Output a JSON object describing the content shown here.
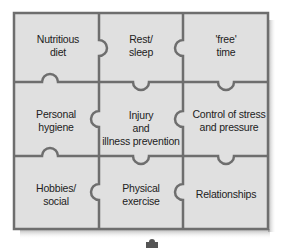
{
  "diagram": {
    "type": "jigsaw-puzzle",
    "colors": {
      "piece_fill": "#e0e0e0",
      "line": "#6e6e6e",
      "shadow": "#9a9a9a",
      "text": "#222222"
    },
    "pieces": [
      {
        "row": 0,
        "col": 0,
        "line1": "Nutritious",
        "line2": "diet",
        "line3": ""
      },
      {
        "row": 0,
        "col": 1,
        "line1": "Rest/",
        "line2": "sleep",
        "line3": ""
      },
      {
        "row": 0,
        "col": 2,
        "line1": "'free'",
        "line2": "time",
        "line3": ""
      },
      {
        "row": 1,
        "col": 0,
        "line1": "Personal",
        "line2": "hygiene",
        "line3": ""
      },
      {
        "row": 1,
        "col": 1,
        "line1": "Injury",
        "line2": "and",
        "line3": "illness prevention"
      },
      {
        "row": 1,
        "col": 2,
        "line1": "Control of stress",
        "line2": "and pressure",
        "line3": ""
      },
      {
        "row": 2,
        "col": 0,
        "line1": "Hobbies/",
        "line2": "social",
        "line3": ""
      },
      {
        "row": 2,
        "col": 1,
        "line1": "Physical",
        "line2": "exercise",
        "line3": ""
      },
      {
        "row": 2,
        "col": 2,
        "line1": "Relationships",
        "line2": "",
        "line3": ""
      }
    ],
    "loose_piece_icon": "puzzle-piece-icon"
  }
}
